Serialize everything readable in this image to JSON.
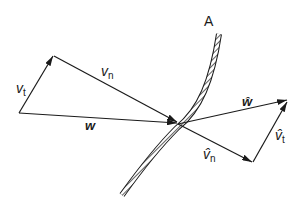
{
  "diagram": {
    "surface_label": "A",
    "vectors": {
      "v_t": {
        "symbol": "v",
        "subscript": "t"
      },
      "v_n": {
        "symbol": "v",
        "subscript": "n"
      },
      "w": {
        "symbol": "w"
      },
      "w_hat": {
        "symbol": "ŵ"
      },
      "v_hat_n": {
        "symbol": "v̂",
        "subscript": "n"
      },
      "v_hat_t": {
        "symbol": "v̂",
        "subscript": "t"
      }
    }
  }
}
